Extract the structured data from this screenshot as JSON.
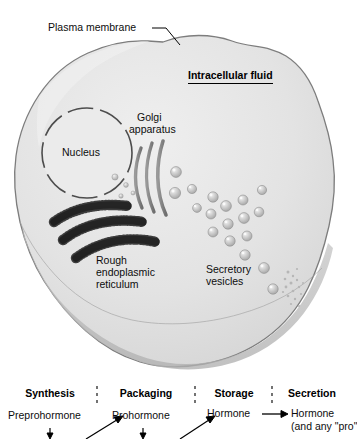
{
  "figure": {
    "type": "biology-diagram",
    "background_color": "#ffffff",
    "cytoplasm_color": "#e2e2e2",
    "membrane_color": "#8e8e8e",
    "organelle_dark": "#3a3a3a",
    "vesicle_color": "#c9c9c9"
  },
  "cell_labels": {
    "plasma_membrane": "Plasma membrane",
    "intracellular_fluid": "Intracellular fluid",
    "nucleus": "Nucleus",
    "golgi_line1": "Golgi",
    "golgi_line2": "apparatus",
    "rough_er_line1": "Rough",
    "rough_er_line2": "endoplasmic",
    "rough_er_line3": "reticulum",
    "secretory_line1": "Secretory",
    "secretory_line2": "vesicles"
  },
  "stages": [
    {
      "name": "Synthesis",
      "label": "Synthesis"
    },
    {
      "name": "Packaging",
      "label": "Packaging"
    },
    {
      "name": "Storage",
      "label": "Storage"
    },
    {
      "name": "Secretion",
      "label": "Secretion"
    }
  ],
  "flow": {
    "step1": "Preprohormone",
    "step2": "Prohormone",
    "step3": "Hormone",
    "step4": "Hormone",
    "step4_sub": "(and any \"pro\""
  },
  "organelles": {
    "golgi_cisternae": 3,
    "rough_er_bands": 3,
    "vesicle_count": 18
  }
}
